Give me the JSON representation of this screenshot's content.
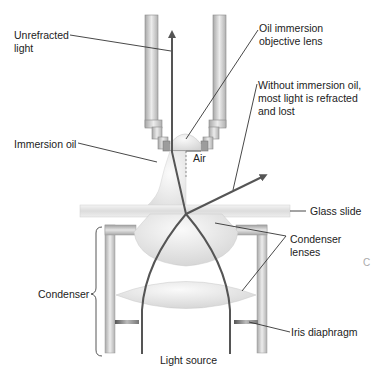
{
  "diagram": {
    "labels": {
      "unrefracted_light": [
        "Unrefracted",
        "light"
      ],
      "oil_immersion_objective": [
        "Oil immersion",
        "objective lens"
      ],
      "without_oil": [
        "Without immersion oil,",
        "most light is refracted",
        "and lost"
      ],
      "immersion_oil": "Immersion oil",
      "air": "Air",
      "glass_slide": "Glass slide",
      "condenser_lenses": [
        "Condenser",
        "lenses"
      ],
      "condenser": "Condenser",
      "iris_diaphragm": "Iris diaphragm",
      "light_source": "Light source"
    },
    "margin_mark": "C",
    "colors": {
      "ray": "#555555",
      "metal_light": "#e6e6e6",
      "metal_dark": "#9a9a9a",
      "lens": "#e8e8e8",
      "oil": "#eeeeee",
      "text": "#222222"
    }
  }
}
